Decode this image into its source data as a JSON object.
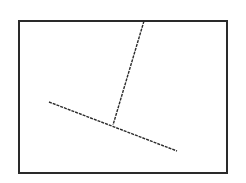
{
  "canvas": {
    "width": 246,
    "height": 183,
    "background": "#ffffff"
  },
  "stroke_color": "#2a2a2a",
  "frame": {
    "x": 19,
    "y": 21,
    "width": 208,
    "height": 152,
    "stroke_width": 2
  },
  "lines": [
    {
      "name": "diagonal-line",
      "x1": 49,
      "y1": 102,
      "x2": 177,
      "y2": 151,
      "stroke_width": 1.4,
      "dash": "3 1"
    },
    {
      "name": "vertical-line",
      "x1": 144,
      "y1": 21,
      "x2": 113,
      "y2": 125,
      "stroke_width": 1.4,
      "dash": "3 1"
    }
  ],
  "junction": {
    "x": 113,
    "y": 125
  }
}
